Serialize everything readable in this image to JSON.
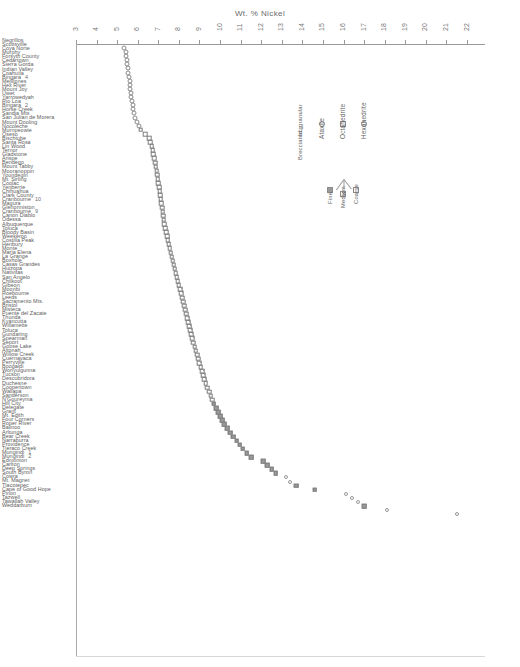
{
  "chart": {
    "title": "Wt. % Nickel",
    "type": "scatter",
    "xlabel": "Wt. % Nickel",
    "ylabel": "",
    "grid": false,
    "xlim": [
      3,
      22
    ]
  },
  "axis": {
    "ticks": [
      "3",
      "4",
      "5",
      "6",
      "7",
      "8",
      "9",
      "10",
      "11",
      "12",
      "13",
      "14",
      "15",
      "16",
      "17",
      "18",
      "19",
      "20",
      "21",
      "22"
    ]
  },
  "legend": {
    "title": "",
    "entries": [
      {
        "key": "hexahedrite",
        "label": "Hexahedrite",
        "symbol": "open-circle"
      },
      {
        "key": "octahedrite",
        "label": "Octahedrite",
        "symbol": "square"
      },
      {
        "key": "ataxite",
        "label": "Ataxite",
        "symbol": "open-circle"
      },
      {
        "key": "brecciated",
        "label": "Brecciated, granular",
        "symbol": "bcg",
        "marker_text": "bcg"
      }
    ],
    "octahedrite_bands": [
      {
        "key": "coarse",
        "label": "Coarse",
        "symbol": "square-open"
      },
      {
        "key": "medium",
        "label": "Medium",
        "symbol": "square-hatched"
      },
      {
        "key": "fine",
        "label": "Fine",
        "symbol": "square-filled"
      }
    ]
  },
  "chart_data": {
    "type": "scatter",
    "title": "Wt. % Nickel",
    "xlabel": "Wt. % Nickel",
    "ylabel": "",
    "xlim": [
      3,
      22
    ],
    "grid": false,
    "legend_position": "upper-right-inset",
    "xticks": [
      3,
      4,
      5,
      6,
      7,
      8,
      9,
      10,
      11,
      12,
      13,
      14,
      15,
      16,
      17,
      18,
      19,
      20,
      21,
      22
    ],
    "series": [
      {
        "name": "Hexahedrite",
        "marker": "open-circle"
      },
      {
        "name": "Octahedrite - Coarse",
        "marker": "square-open"
      },
      {
        "name": "Octahedrite - Medium",
        "marker": "square-hatched"
      },
      {
        "name": "Octahedrite - Fine",
        "marker": "square-filled"
      },
      {
        "name": "Ataxite",
        "marker": "open-circle"
      }
    ],
    "points": [
      {
        "name": "Negrillos",
        "value": 5.35,
        "class": "hex"
      },
      {
        "name": "Scottsville",
        "value": 5.42,
        "class": "hex"
      },
      {
        "name": "Coya Norte",
        "value": 5.45,
        "class": "hex"
      },
      {
        "name": "Murphy",
        "value": 5.48,
        "class": "hex"
      },
      {
        "name": "Forsyth County",
        "value": 5.5,
        "class": "hex"
      },
      {
        "name": "Cedartown",
        "value": 5.52,
        "class": "hex"
      },
      {
        "name": "Sierra Gorda",
        "value": 5.55,
        "class": "hex"
      },
      {
        "name": "Indian Valley",
        "value": 5.58,
        "class": "hex"
      },
      {
        "name": "Coahuila",
        "value": 5.6,
        "class": "hex"
      },
      {
        "name": "Bingara",
        "value": 5.62,
        "class": "hex",
        "specimen": "4"
      },
      {
        "name": "Mejillones",
        "value": 5.64,
        "class": "hex"
      },
      {
        "name": "Hex River",
        "value": 5.66,
        "class": "hex"
      },
      {
        "name": "Mount Joy",
        "value": 5.68,
        "class": "hex"
      },
      {
        "name": "Uwet",
        "value": 5.72,
        "class": "hex"
      },
      {
        "name": "Yarrowedyah",
        "value": 5.75,
        "class": "hex"
      },
      {
        "name": "Rio Loa",
        "value": 5.78,
        "class": "hex"
      },
      {
        "name": "Bingara",
        "value": 5.82,
        "class": "hex",
        "specimen": "2"
      },
      {
        "name": "Horse Creek",
        "value": 5.85,
        "class": "hex"
      },
      {
        "name": "Sandia Mts",
        "value": 5.95,
        "class": "hex"
      },
      {
        "name": "San Julian de Morera",
        "value": 6.05,
        "class": "hex"
      },
      {
        "name": "Mount Dooling",
        "value": 6.15,
        "class": "oct coarse"
      },
      {
        "name": "Nocoleche",
        "value": 6.35,
        "class": "oct coarse"
      },
      {
        "name": "Murnpeowie",
        "value": 6.55,
        "class": "oct coarse"
      },
      {
        "name": "Oseso",
        "value": 6.62,
        "class": "oct coarse"
      },
      {
        "name": "Bischtube",
        "value": 6.68,
        "class": "oct coarse"
      },
      {
        "name": "Santa Rosa",
        "value": 6.72,
        "class": "oct coarse"
      },
      {
        "name": "Lin Wood",
        "value": 6.76,
        "class": "oct coarse"
      },
      {
        "name": "Ternor",
        "value": 6.8,
        "class": "oct coarse"
      },
      {
        "name": "Gladstone",
        "value": 6.84,
        "class": "oct coarse"
      },
      {
        "name": "Arispe",
        "value": 6.88,
        "class": "oct coarse"
      },
      {
        "name": "Bendego",
        "value": 6.92,
        "class": "oct coarse"
      },
      {
        "name": "Mount Tabby",
        "value": 6.95,
        "class": "oct coarse"
      },
      {
        "name": "Mooranoppin",
        "value": 6.98,
        "class": "oct coarse"
      },
      {
        "name": "Youndegin",
        "value": 7.0,
        "class": "oct coarse"
      },
      {
        "name": "Mt. Sirling",
        "value": 7.03,
        "class": "oct coarse"
      },
      {
        "name": "Coolac",
        "value": 7.06,
        "class": "oct coarse"
      },
      {
        "name": "Yenberrie",
        "value": 7.09,
        "class": "oct coarse"
      },
      {
        "name": "Chihuahua",
        "value": 7.12,
        "class": "oct coarse"
      },
      {
        "name": "Clark County",
        "value": 7.15,
        "class": "oct coarse"
      },
      {
        "name": "Cranbourne",
        "value": 7.18,
        "class": "oct coarse",
        "specimen": "10"
      },
      {
        "name": "Magura",
        "value": 7.21,
        "class": "oct coarse"
      },
      {
        "name": "Glenormiston",
        "value": 7.24,
        "class": "oct coarse"
      },
      {
        "name": "Cranbourne",
        "value": 7.27,
        "class": "oct coarse",
        "specimen": "9"
      },
      {
        "name": "Canon Diablo",
        "value": 7.3,
        "class": "oct coarse"
      },
      {
        "name": "Odessa",
        "value": 7.34,
        "class": "oct coarse"
      },
      {
        "name": "Albuquerque",
        "value": 7.38,
        "class": "oct coarse"
      },
      {
        "name": "Toluca",
        "value": 7.42,
        "class": "oct coarse"
      },
      {
        "name": "Bloody Basin",
        "value": 7.46,
        "class": "oct coarse"
      },
      {
        "name": "Weekeroo",
        "value": 7.5,
        "class": "oct coarse"
      },
      {
        "name": "Costilla Peak",
        "value": 7.55,
        "class": "oct coarse"
      },
      {
        "name": "Henbury",
        "value": 7.6,
        "class": "oct coarse"
      },
      {
        "name": "Monte",
        "value": 7.65,
        "class": "oct coarse"
      },
      {
        "name": "Maria Elena",
        "value": 7.7,
        "class": "oct coarse"
      },
      {
        "name": "La Grange",
        "value": 7.75,
        "class": "oct coarse"
      },
      {
        "name": "Boxhole",
        "value": 7.8,
        "class": "oct coarse"
      },
      {
        "name": "Casas Grandes",
        "value": 7.85,
        "class": "oct coarse"
      },
      {
        "name": "Huizopa",
        "value": 7.9,
        "class": "oct medium"
      },
      {
        "name": "Nativitas",
        "value": 7.95,
        "class": "oct medium"
      },
      {
        "name": "San Angelo",
        "value": 8.0,
        "class": "oct medium"
      },
      {
        "name": "Chilkoot",
        "value": 8.05,
        "class": "oct medium"
      },
      {
        "name": "Gibeon",
        "value": 8.1,
        "class": "oct medium"
      },
      {
        "name": "Moonbi",
        "value": 8.15,
        "class": "oct medium"
      },
      {
        "name": "Roebourne",
        "value": 8.2,
        "class": "oct medium"
      },
      {
        "name": "Leeds",
        "value": 8.25,
        "class": "oct medium"
      },
      {
        "name": "Sacramento Mts.",
        "value": 8.3,
        "class": "oct medium"
      },
      {
        "name": "Bristol",
        "value": 8.35,
        "class": "oct medium"
      },
      {
        "name": "Misteca",
        "value": 8.4,
        "class": "oct medium"
      },
      {
        "name": "Puente del Zacate",
        "value": 8.45,
        "class": "oct medium"
      },
      {
        "name": "Thunda",
        "value": 8.5,
        "class": "oct medium"
      },
      {
        "name": "Kyancutta",
        "value": 8.55,
        "class": "oct medium"
      },
      {
        "name": "Willamette",
        "value": 8.6,
        "class": "oct medium"
      },
      {
        "name": "Toluca",
        "value": 8.65,
        "class": "oct medium"
      },
      {
        "name": "Gundaring",
        "value": 8.7,
        "class": "oct medium"
      },
      {
        "name": "Spearman",
        "value": 8.76,
        "class": "oct medium"
      },
      {
        "name": "Seport",
        "value": 8.82,
        "class": "oct medium"
      },
      {
        "name": "Goose Lake",
        "value": 8.88,
        "class": "oct medium"
      },
      {
        "name": "Altonah",
        "value": 8.94,
        "class": "oct medium"
      },
      {
        "name": "Willow Creek",
        "value": 9.0,
        "class": "oct medium"
      },
      {
        "name": "Cuernavaca",
        "value": 9.06,
        "class": "oct medium"
      },
      {
        "name": "Perryville",
        "value": 9.12,
        "class": "oct medium"
      },
      {
        "name": "Boogaldi",
        "value": 9.18,
        "class": "oct medium"
      },
      {
        "name": "Wonyulgunna",
        "value": 9.24,
        "class": "oct medium"
      },
      {
        "name": "Tucson",
        "value": 9.3,
        "class": "oct medium"
      },
      {
        "name": "Descubridora",
        "value": 9.38,
        "class": "oct medium"
      },
      {
        "name": "Duchesne",
        "value": 9.46,
        "class": "oct medium"
      },
      {
        "name": "Coopertown",
        "value": 9.54,
        "class": "oct medium"
      },
      {
        "name": "Wallapa",
        "value": 9.62,
        "class": "oct medium"
      },
      {
        "name": "Sanderson",
        "value": 9.7,
        "class": "oct fine"
      },
      {
        "name": "N'Goureyma",
        "value": 9.8,
        "class": "oct fine"
      },
      {
        "name": "Hill City",
        "value": 9.9,
        "class": "oct fine"
      },
      {
        "name": "Delegate",
        "value": 10.0,
        "class": "oct fine"
      },
      {
        "name": "Grant",
        "value": 10.1,
        "class": "oct fine"
      },
      {
        "name": "Mt. Edith",
        "value": 10.2,
        "class": "oct fine"
      },
      {
        "name": "Four Corners",
        "value": 10.35,
        "class": "oct fine"
      },
      {
        "name": "Roper River",
        "value": 10.5,
        "class": "oct fine"
      },
      {
        "name": "Balinoo",
        "value": 10.65,
        "class": "oct fine"
      },
      {
        "name": "Arltunga",
        "value": 10.8,
        "class": "oct fine"
      },
      {
        "name": "Bear Creek",
        "value": 10.95,
        "class": "oct fine"
      },
      {
        "name": "Narraburra",
        "value": 11.1,
        "class": "oct fine"
      },
      {
        "name": "Providence",
        "value": 11.3,
        "class": "oct fine"
      },
      {
        "name": "Tieraco Creek",
        "value": 11.5,
        "class": "oct fine"
      },
      {
        "name": "Mungindi",
        "value": 12.1,
        "class": "oct fine",
        "specimen": "1"
      },
      {
        "name": "Mungindi",
        "value": 12.3,
        "class": "oct fine",
        "specimen": "2"
      },
      {
        "name": "Edmonton",
        "value": 12.5,
        "class": "oct fine"
      },
      {
        "name": "Carlton",
        "value": 12.7,
        "class": "oct fine"
      },
      {
        "name": "Deep Springs",
        "value": 13.2,
        "class": "atax"
      },
      {
        "name": "South Byron",
        "value": 13.4,
        "class": "atax"
      },
      {
        "name": "Cowra",
        "value": 13.7,
        "class": "oct fine"
      },
      {
        "name": "Mt. Magnet",
        "value": 14.6,
        "class": "oct fine"
      },
      {
        "name": "Tlacotepec",
        "value": 16.1,
        "class": "atax"
      },
      {
        "name": "Cape of Good Hope",
        "value": 16.4,
        "class": "atax"
      },
      {
        "name": "Pinon",
        "value": 16.7,
        "class": "atax"
      },
      {
        "name": "Tazwell",
        "value": 17.0,
        "class": "oct fine"
      },
      {
        "name": "Tawallah Valley",
        "value": 18.1,
        "class": "atax"
      },
      {
        "name": "Weddarburn",
        "value": 21.5,
        "class": "atax"
      }
    ]
  },
  "names": [
    {
      "label": "Negrillos"
    },
    {
      "label": "Scottsville"
    },
    {
      "label": "Coya Norte"
    },
    {
      "label": "Murphy"
    },
    {
      "label": "Forsyth County"
    },
    {
      "label": "Cedartown"
    },
    {
      "label": "Sierra Gorda"
    },
    {
      "label": "Indian Valley"
    },
    {
      "label": "Coahuila"
    },
    {
      "label": "Bingara",
      "specimen": "4"
    },
    {
      "label": "Mejillones"
    },
    {
      "label": "Hex River"
    },
    {
      "label": "Mount Joy"
    },
    {
      "label": "Uwet"
    },
    {
      "label": "Yarrowedyah"
    },
    {
      "label": "Rio Loa"
    },
    {
      "label": "Bingara",
      "specimen": "2"
    },
    {
      "label": "Horse Creek"
    },
    {
      "label": "Sandia Mts"
    },
    {
      "label": "San Julian de Morera"
    },
    {
      "label": "Mount Dooling"
    },
    {
      "label": "Nocoleche"
    },
    {
      "label": "Murnpeowie"
    },
    {
      "label": "Oseso"
    },
    {
      "label": "Bischtube"
    },
    {
      "label": "Santa Rosa"
    },
    {
      "label": "Lin Wood"
    },
    {
      "label": "Ternor"
    },
    {
      "label": "Gladstone"
    },
    {
      "label": "Arispe"
    },
    {
      "label": "Bendego"
    },
    {
      "label": "Mount Tabby"
    },
    {
      "label": "Mooranoppin"
    },
    {
      "label": "Youndegin"
    },
    {
      "label": "Mt. Sirling"
    },
    {
      "label": "Coolac"
    },
    {
      "label": "Yenberrie"
    },
    {
      "label": "Chihuahua"
    },
    {
      "label": "Clark County"
    },
    {
      "label": "Cranbourne",
      "specimen": "10"
    },
    {
      "label": "Magura"
    },
    {
      "label": "Glenormiston"
    },
    {
      "label": "Cranbourne",
      "specimen": "9"
    },
    {
      "label": "Canon Diablo"
    },
    {
      "label": "Odessa"
    },
    {
      "label": "Albuquerque"
    },
    {
      "label": "Toluca"
    },
    {
      "label": "Bloody Basin"
    },
    {
      "label": "Weekeroo"
    },
    {
      "label": "Costilla Peak"
    },
    {
      "label": "Henbury"
    },
    {
      "label": "Monte"
    },
    {
      "label": "Maria Elena"
    },
    {
      "label": "La Grange"
    },
    {
      "label": "Boxhole"
    },
    {
      "label": "Casas Grandes"
    },
    {
      "label": "Huizopa"
    },
    {
      "label": "Nativitas"
    },
    {
      "label": "San Angelo"
    },
    {
      "label": "Chilkoot"
    },
    {
      "label": "Gibeon"
    },
    {
      "label": "Moonbi"
    },
    {
      "label": "Roebourne"
    },
    {
      "label": "Leeds"
    },
    {
      "label": "Sacramento Mts."
    },
    {
      "label": "Bristol"
    },
    {
      "label": "Misteca"
    },
    {
      "label": "Puente del Zacate"
    },
    {
      "label": "Thunda"
    },
    {
      "label": "Kyancutta"
    },
    {
      "label": "Willamette"
    },
    {
      "label": "Toluca"
    },
    {
      "label": "Gundaring"
    },
    {
      "label": "Spearman"
    },
    {
      "label": "Seport"
    },
    {
      "label": "Goose Lake"
    },
    {
      "label": "Altonah"
    },
    {
      "label": "Willow Creek"
    },
    {
      "label": "Cuernavaca"
    },
    {
      "label": "Perryville"
    },
    {
      "label": "Boogaldi"
    },
    {
      "label": "Wonyulgunna"
    },
    {
      "label": "Tucson"
    },
    {
      "label": "Descubridora"
    },
    {
      "label": "Duchesne"
    },
    {
      "label": "Coopertown"
    },
    {
      "label": "Wallapa"
    },
    {
      "label": "Sanderson"
    },
    {
      "label": "N'Goureyma"
    },
    {
      "label": "Hill City"
    },
    {
      "label": "Delegate"
    },
    {
      "label": "Grant"
    },
    {
      "label": "Mt. Edith"
    },
    {
      "label": "Four Corners"
    },
    {
      "label": "Roper River"
    },
    {
      "label": "Balinoo"
    },
    {
      "label": "Arltunga"
    },
    {
      "label": "Bear Creek"
    },
    {
      "label": "Narraburra"
    },
    {
      "label": "Providence"
    },
    {
      "label": "Tieraco Creek"
    },
    {
      "label": "Mungindi",
      "specimen": "1"
    },
    {
      "label": "Mungindi",
      "specimen": "2"
    },
    {
      "label": "Edmonton"
    },
    {
      "label": "Carlton"
    },
    {
      "label": "Deep Springs"
    },
    {
      "label": "South Byron"
    },
    {
      "label": "Cowra"
    },
    {
      "label": "Mt. Magnet"
    },
    {
      "label": "Tlacotepec"
    },
    {
      "label": "Cape of Good Hope"
    },
    {
      "label": "Pinon"
    },
    {
      "label": "Tazwell"
    },
    {
      "label": "Tawallah Valley"
    },
    {
      "label": "Weddarburn"
    }
  ]
}
